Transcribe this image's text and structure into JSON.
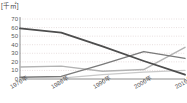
{
  "chart_data": {
    "type": "line",
    "title": "",
    "subtitle": "",
    "xlabel": "",
    "ylabel": "[千㎡]",
    "unit_label": "[千㎡]",
    "x": [
      "1970年",
      "1980年",
      "1990年",
      "2000年",
      "2010年"
    ],
    "categories": [
      "1970年",
      "1980年",
      "1990年",
      "2000年",
      "2010年"
    ],
    "ylim": [
      0,
      70
    ],
    "yticks": [
      70,
      60,
      50,
      40,
      30,
      20,
      10,
      0
    ],
    "grid": true,
    "grid_style": "dotted-horizontal",
    "legend": false,
    "legend_position": "none",
    "series": [
      {
        "name": "series-1-dark",
        "color": "#4d4d4d",
        "width": 1.8,
        "values": [
          59,
          54,
          38,
          21,
          5
        ]
      },
      {
        "name": "series-2-medium",
        "color": "#7a7a7a",
        "width": 1.4,
        "values": [
          2,
          3,
          17,
          32,
          24
        ]
      },
      {
        "name": "series-3-light",
        "color": "#b3b3b3",
        "width": 1.4,
        "values": [
          14,
          15,
          9,
          11,
          37
        ]
      },
      {
        "name": "series-4-pale",
        "color": "#c9c9c9",
        "width": 1.3,
        "values": [
          0,
          1,
          5,
          8,
          10
        ]
      }
    ]
  },
  "axis": {
    "unit": "[千㎡]",
    "y_ticks": [
      "70",
      "60",
      "50",
      "40",
      "30",
      "20",
      "10",
      "0"
    ],
    "x_ticks": [
      "1970年",
      "1980年",
      "1990年",
      "2000年",
      "2010年"
    ]
  },
  "colors": {
    "axis": "#808080",
    "grid": "#d9c9c9",
    "text": "#555555",
    "series_1": "#4d4d4d",
    "series_2": "#7a7a7a",
    "series_3": "#b3b3b3",
    "series_4": "#c9c9c9",
    "background": "#ffffff"
  }
}
